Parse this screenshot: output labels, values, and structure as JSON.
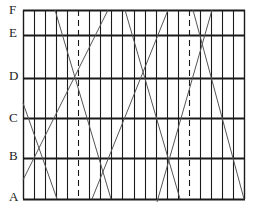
{
  "diagram": {
    "row_labels": [
      {
        "label": "F",
        "y": 10
      },
      {
        "label": "E",
        "y": 35
      },
      {
        "label": "D",
        "y": 78
      },
      {
        "label": "C",
        "y": 118
      },
      {
        "label": "B",
        "y": 158
      },
      {
        "label": "A",
        "y": 199
      }
    ],
    "grid": {
      "left": 23,
      "right": 244,
      "top": 10,
      "bottom": 199,
      "columns": 20
    },
    "dashed_columns": [
      5,
      15
    ],
    "diagonals": [
      {
        "x1": 23,
        "y1": 103,
        "x2": 57,
        "y2": 199
      },
      {
        "x1": 23,
        "y1": 180,
        "x2": 108,
        "y2": 10
      },
      {
        "x1": 55,
        "y1": 10,
        "x2": 111,
        "y2": 199
      },
      {
        "x1": 92,
        "y1": 199,
        "x2": 168,
        "y2": 10
      },
      {
        "x1": 125,
        "y1": 10,
        "x2": 180,
        "y2": 199
      },
      {
        "x1": 193,
        "y1": 10,
        "x2": 244,
        "y2": 199
      },
      {
        "x1": 212,
        "y1": 10,
        "x2": 157,
        "y2": 202
      }
    ],
    "colors": {
      "line": "#1a1a1a",
      "diagonal": "#555555",
      "background": "#ffffff"
    }
  }
}
